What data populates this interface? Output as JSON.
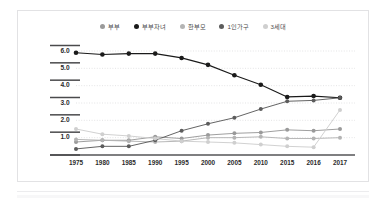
{
  "chart_data": {
    "type": "line",
    "title": "",
    "subtitle": "",
    "xlabel": "",
    "ylabel": "",
    "grid": true,
    "legend_position": "top-center",
    "x": [
      "1975",
      "1980",
      "1985",
      "1990",
      "1995",
      "2000",
      "2005",
      "2010",
      "2015",
      "2016",
      "2017"
    ],
    "categories": [
      "1975",
      "1980",
      "1985",
      "1990",
      "1995",
      "2000",
      "2005",
      "2010",
      "2015",
      "2016",
      "2017"
    ],
    "ylim": [
      0.0,
      6.5
    ],
    "xlim": [
      "1975",
      "2017"
    ],
    "ytick_labels": [
      "6.0",
      "5.0",
      "4.0",
      "3.0",
      "2.0",
      "1.0"
    ],
    "ytick_values": [
      6.0,
      5.0,
      4.0,
      3.0,
      2.0,
      1.0
    ],
    "series": [
      {
        "name": "부부",
        "color": "#9a9a9a",
        "values": [
          0.75,
          0.85,
          0.85,
          1.05,
          0.95,
          1.15,
          1.25,
          1.3,
          1.45,
          1.4,
          1.5
        ]
      },
      {
        "name": "부부자녀",
        "color": "#1a1a1a",
        "values": [
          5.9,
          5.8,
          5.85,
          5.85,
          5.6,
          5.2,
          4.6,
          4.05,
          3.35,
          3.4,
          3.3
        ]
      },
      {
        "name": "한부모",
        "color": "#b4b4b4",
        "values": [
          0.9,
          0.85,
          0.8,
          0.75,
          0.8,
          1.0,
          1.0,
          1.05,
          0.95,
          0.95,
          1.0
        ]
      },
      {
        "name": "1인가구",
        "color": "#5c5c5c",
        "values": [
          0.35,
          0.5,
          0.5,
          0.85,
          1.4,
          1.8,
          2.15,
          2.65,
          3.1,
          3.15,
          3.3
        ]
      },
      {
        "name": "3세대",
        "color": "#cfcfcf",
        "values": [
          1.5,
          1.2,
          1.1,
          0.95,
          0.8,
          0.75,
          0.7,
          0.6,
          0.5,
          0.45,
          2.6
        ]
      }
    ]
  },
  "legend": {
    "items": [
      {
        "label": "부부",
        "color": "#9a9a9a",
        "marker": "legend-dot-marker"
      },
      {
        "label": "부부자녀",
        "color": "#1a1a1a",
        "marker": "legend-dot-marker"
      },
      {
        "label": "한부모",
        "color": "#b4b4b4",
        "marker": "legend-dot-marker"
      },
      {
        "label": "1인가구",
        "color": "#5c5c5c",
        "marker": "legend-dot-marker"
      },
      {
        "label": "3세대",
        "color": "#cfcfcf",
        "marker": "legend-dot-marker"
      }
    ]
  },
  "axes": {
    "y_ticks": [
      "6.0",
      "5.0",
      "4.0",
      "3.0",
      "2.0",
      "1.0"
    ],
    "x_ticks": [
      "1975",
      "1980",
      "1985",
      "1990",
      "1995",
      "2000",
      "2005",
      "2010",
      "2015",
      "2016",
      "2017"
    ]
  },
  "colors": {
    "frame_border": "#e2e2e4",
    "grid_line": "#d8d8da",
    "axis_line": "#555557",
    "tick_bar": "#4a4a4c",
    "background": "#ffffff"
  }
}
